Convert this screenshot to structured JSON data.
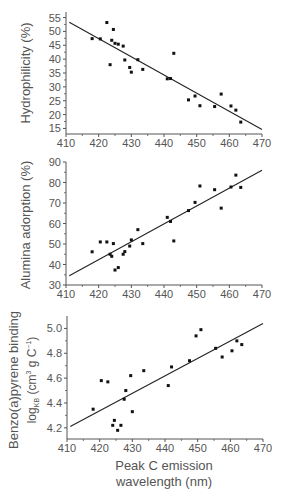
{
  "figure": {
    "xlabel_line1": "Peak C emission",
    "xlabel_line2": "wavelength (nm)"
  },
  "chart_data": [
    {
      "type": "scatter",
      "title": "",
      "xlabel": "",
      "ylabel": "Hydrophilicity (%)",
      "xlim": [
        410,
        470
      ],
      "ylim": [
        13,
        57
      ],
      "x_ticks": [
        410,
        420,
        430,
        440,
        450,
        460,
        470
      ],
      "y_ticks": [
        15,
        20,
        25,
        30,
        35,
        40,
        45,
        50,
        55
      ],
      "y_tick_labels": [
        "15",
        "20",
        "25",
        "30",
        "35",
        "40",
        "45",
        "50",
        "55"
      ],
      "grid": false,
      "legend": null,
      "trendline": {
        "x": [
          411,
          470
        ],
        "y": [
          53.3,
          14.6
        ]
      },
      "points": [
        {
          "x": 418,
          "y": 47.4
        },
        {
          "x": 420.5,
          "y": 47.3
        },
        {
          "x": 422.5,
          "y": 53.2
        },
        {
          "x": 423.5,
          "y": 38.0
        },
        {
          "x": 424,
          "y": 46.8
        },
        {
          "x": 424.5,
          "y": 50.7
        },
        {
          "x": 425,
          "y": 45.7
        },
        {
          "x": 426,
          "y": 45.4
        },
        {
          "x": 427.5,
          "y": 44.7
        },
        {
          "x": 428,
          "y": 39.7
        },
        {
          "x": 429.5,
          "y": 37.0
        },
        {
          "x": 430,
          "y": 35.3
        },
        {
          "x": 432,
          "y": 39.8
        },
        {
          "x": 433.5,
          "y": 36.3
        },
        {
          "x": 441,
          "y": 32.9
        },
        {
          "x": 442,
          "y": 33.0
        },
        {
          "x": 443,
          "y": 42.1
        },
        {
          "x": 447.5,
          "y": 25.3
        },
        {
          "x": 449.5,
          "y": 26.7
        },
        {
          "x": 451,
          "y": 23.2
        },
        {
          "x": 455.5,
          "y": 22.9
        },
        {
          "x": 457.5,
          "y": 27.4
        },
        {
          "x": 460.5,
          "y": 23.1
        },
        {
          "x": 462,
          "y": 21.6
        },
        {
          "x": 463.5,
          "y": 17.3
        }
      ]
    },
    {
      "type": "scatter",
      "title": "",
      "xlabel": "",
      "ylabel": "Alumina adorption (%)",
      "xlim": [
        410,
        470
      ],
      "ylim": [
        30,
        90
      ],
      "x_ticks": [
        410,
        420,
        430,
        440,
        450,
        460,
        470
      ],
      "y_ticks": [
        30,
        40,
        50,
        60,
        70,
        80,
        90
      ],
      "y_tick_labels": [
        "30",
        "40",
        "50",
        "60",
        "70",
        "80",
        "90"
      ],
      "grid": false,
      "legend": null,
      "trendline": {
        "x": [
          411,
          470
        ],
        "y": [
          34.5,
          86
        ]
      },
      "points": [
        {
          "x": 418,
          "y": 46.2
        },
        {
          "x": 420.5,
          "y": 51.0
        },
        {
          "x": 422.5,
          "y": 51.0
        },
        {
          "x": 423.5,
          "y": 45.0
        },
        {
          "x": 424,
          "y": 44.0
        },
        {
          "x": 424.5,
          "y": 50.2
        },
        {
          "x": 425,
          "y": 37.3
        },
        {
          "x": 426,
          "y": 38.5
        },
        {
          "x": 427.5,
          "y": 45.0
        },
        {
          "x": 428,
          "y": 46.3
        },
        {
          "x": 429.5,
          "y": 49.0
        },
        {
          "x": 430,
          "y": 52.0
        },
        {
          "x": 432,
          "y": 57.0
        },
        {
          "x": 433.5,
          "y": 50.2
        },
        {
          "x": 441,
          "y": 63.0
        },
        {
          "x": 442,
          "y": 61.0
        },
        {
          "x": 443,
          "y": 51.5
        },
        {
          "x": 447.5,
          "y": 66.3
        },
        {
          "x": 449.5,
          "y": 70.3
        },
        {
          "x": 451,
          "y": 78.3
        },
        {
          "x": 455.5,
          "y": 76.5
        },
        {
          "x": 457.5,
          "y": 67.5
        },
        {
          "x": 460.5,
          "y": 77.8
        },
        {
          "x": 462,
          "y": 83.6
        },
        {
          "x": 463.5,
          "y": 77.6
        }
      ]
    },
    {
      "type": "scatter",
      "title": "",
      "xlabel": "Peak C emission wavelength (nm)",
      "ylabel": "Benzo(a)pyrene binding log_KB (cm3 g C-1)",
      "ylabel_line1": "Benzo(a)pyrene binding",
      "ylabel_line2_prefix": "log",
      "ylabel_line2_sub": "KB",
      "ylabel_line2_mid": " (cm",
      "ylabel_line2_sup": "3",
      "ylabel_line2_mid2": " g C",
      "ylabel_line2_sup2": "−1",
      "ylabel_line2_end": ")",
      "xlim": [
        410,
        470
      ],
      "ylim": [
        4.11,
        5.1
      ],
      "x_ticks": [
        410,
        420,
        430,
        440,
        450,
        460,
        470
      ],
      "x_tick_labels": [
        "410",
        "420",
        "430",
        "440",
        "450",
        "460",
        "470"
      ],
      "y_ticks": [
        4.2,
        4.4,
        4.6,
        4.8,
        5.0
      ],
      "y_tick_labels": [
        "4.2",
        "4.4",
        "4.6",
        "4.8",
        "5.0"
      ],
      "grid": false,
      "legend": null,
      "trendline": {
        "x": [
          411,
          470
        ],
        "y": [
          4.21,
          5.04
        ]
      },
      "points": [
        {
          "x": 418,
          "y": 4.35
        },
        {
          "x": 420.5,
          "y": 4.58
        },
        {
          "x": 422.5,
          "y": 4.57
        },
        {
          "x": 424,
          "y": 4.22
        },
        {
          "x": 424.5,
          "y": 4.26
        },
        {
          "x": 425.5,
          "y": 4.18
        },
        {
          "x": 426.5,
          "y": 4.22
        },
        {
          "x": 427.5,
          "y": 4.43
        },
        {
          "x": 428,
          "y": 4.5
        },
        {
          "x": 429.5,
          "y": 4.62
        },
        {
          "x": 430,
          "y": 4.33
        },
        {
          "x": 433.5,
          "y": 4.66
        },
        {
          "x": 441,
          "y": 4.54
        },
        {
          "x": 442,
          "y": 4.69
        },
        {
          "x": 447.5,
          "y": 4.74
        },
        {
          "x": 449.5,
          "y": 4.94
        },
        {
          "x": 451,
          "y": 4.99
        },
        {
          "x": 455.5,
          "y": 4.84
        },
        {
          "x": 457.5,
          "y": 4.77
        },
        {
          "x": 460.5,
          "y": 4.82
        },
        {
          "x": 462,
          "y": 4.9
        },
        {
          "x": 463.5,
          "y": 4.87
        }
      ]
    }
  ],
  "layout": {
    "panels": [
      {
        "left": 66,
        "right": 262,
        "top": 12,
        "bottom": 134,
        "ylabel_x": 30,
        "ylabel_y": 73,
        "xtick_y": 147
      },
      {
        "left": 66,
        "right": 262,
        "top": 162,
        "bottom": 285,
        "ylabel_x": 30,
        "ylabel_y": 225,
        "xtick_y": 298
      },
      {
        "left": 67,
        "right": 263,
        "top": 316,
        "bottom": 439,
        "ylabel_x": 18,
        "ylabel_y": 380,
        "ylabel2_x": 36,
        "xtick_y": 452
      }
    ],
    "xlabel_line1_y": 470,
    "xlabel_line2_y": 486,
    "xlabel_x": 164,
    "colors": {
      "axis": "#555555",
      "text": "#555555",
      "marker": "#111111",
      "line": "#222222"
    }
  }
}
